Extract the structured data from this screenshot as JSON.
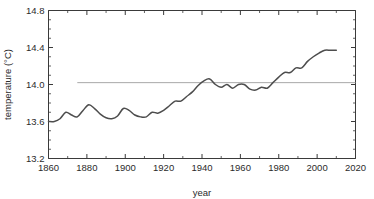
{
  "chart_data": {
    "type": "line",
    "title": "",
    "xlabel": "year",
    "ylabel": "temperature (°C)",
    "xlim": [
      1860,
      2020
    ],
    "ylim": [
      13.2,
      14.8
    ],
    "xticks": [
      1860,
      1880,
      1900,
      1920,
      1940,
      1960,
      1980,
      2000,
      2020
    ],
    "yticks": [
      13.2,
      13.6,
      14.0,
      14.4,
      14.8
    ],
    "xtick_labels": [
      "1860",
      "1880",
      "1900",
      "1920",
      "1940",
      "1960",
      "1980",
      "2000",
      "2020"
    ],
    "ytick_labels": [
      "13.2",
      "13.6",
      "14.0",
      "14.4",
      "14.8"
    ],
    "xminor_step": 10,
    "yminor_step": 0.1,
    "grid": false,
    "legend": null,
    "series": [
      {
        "name": "global mean temperature",
        "color": "#4d4d4d",
        "x": [
          1860,
          1863,
          1866,
          1869,
          1872,
          1875,
          1878,
          1881,
          1884,
          1887,
          1890,
          1893,
          1896,
          1899,
          1902,
          1905,
          1908,
          1911,
          1914,
          1917,
          1920,
          1923,
          1926,
          1929,
          1932,
          1935,
          1938,
          1941,
          1944,
          1947,
          1950,
          1953,
          1956,
          1959,
          1962,
          1965,
          1968,
          1971,
          1974,
          1977,
          1980,
          1983,
          1986,
          1989,
          1992,
          1995,
          1998,
          2001,
          2004,
          2007,
          2010
        ],
        "y": [
          13.6,
          13.6,
          13.63,
          13.7,
          13.67,
          13.65,
          13.72,
          13.78,
          13.74,
          13.68,
          13.64,
          13.63,
          13.66,
          13.74,
          13.72,
          13.67,
          13.65,
          13.65,
          13.7,
          13.69,
          13.72,
          13.77,
          13.82,
          13.82,
          13.87,
          13.92,
          13.99,
          14.04,
          14.06,
          14.0,
          13.97,
          14.0,
          13.96,
          14.0,
          14.0,
          13.95,
          13.94,
          13.97,
          13.96,
          14.02,
          14.08,
          14.13,
          14.13,
          14.18,
          14.18,
          14.25,
          14.3,
          14.34,
          14.37,
          14.37,
          14.37
        ]
      }
    ],
    "reference_line": {
      "name": "1961-1990 reference level",
      "color": "#a8a8a8",
      "value": 14.02,
      "x_start": 1875,
      "x_end": 2020
    }
  }
}
